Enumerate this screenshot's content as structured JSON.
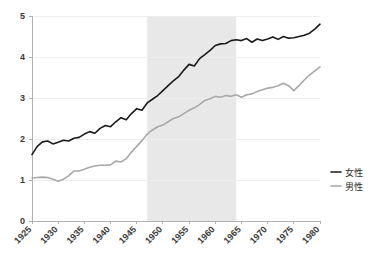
{
  "chart_data": {
    "type": "line",
    "title": "",
    "subtitle": "",
    "xlabel": "",
    "ylabel": "",
    "xlim": [
      1925,
      1980
    ],
    "ylim": [
      0,
      5
    ],
    "grid": true,
    "legend_position": "right",
    "x_tick_labels": [
      "1925",
      "1930",
      "1935",
      "1940",
      "1945",
      "1950",
      "1955",
      "1960",
      "1965",
      "1970",
      "1975",
      "1980"
    ],
    "x_ticks": [
      1925,
      1930,
      1935,
      1940,
      1945,
      1950,
      1955,
      1960,
      1965,
      1970,
      1975,
      1980
    ],
    "y_tick_labels": [
      "0",
      "1",
      "2",
      "3",
      "4",
      "5"
    ],
    "y_ticks": [
      0,
      1,
      2,
      3,
      4,
      5
    ],
    "shaded_region": {
      "x_start": 1947,
      "x_end": 1964,
      "color": "#e8e8e8"
    },
    "x": [
      1925,
      1926,
      1927,
      1928,
      1929,
      1930,
      1931,
      1932,
      1933,
      1934,
      1935,
      1936,
      1937,
      1938,
      1939,
      1940,
      1941,
      1942,
      1943,
      1944,
      1945,
      1946,
      1947,
      1948,
      1949,
      1950,
      1951,
      1952,
      1953,
      1954,
      1955,
      1956,
      1957,
      1958,
      1959,
      1960,
      1961,
      1962,
      1963,
      1964,
      1965,
      1966,
      1967,
      1968,
      1969,
      1970,
      1971,
      1972,
      1973,
      1974,
      1975,
      1976,
      1977,
      1978,
      1979,
      1980
    ],
    "series": [
      {
        "name": "女性",
        "color": "#1a1a1a",
        "width": 1.6,
        "values": [
          1.62,
          1.82,
          1.93,
          1.95,
          1.88,
          1.92,
          1.97,
          1.95,
          2.02,
          2.04,
          2.12,
          2.18,
          2.14,
          2.26,
          2.33,
          2.3,
          2.42,
          2.52,
          2.47,
          2.62,
          2.74,
          2.7,
          2.88,
          2.97,
          3.06,
          3.18,
          3.3,
          3.42,
          3.52,
          3.68,
          3.82,
          3.78,
          3.96,
          4.06,
          4.16,
          4.28,
          4.32,
          4.33,
          4.4,
          4.42,
          4.4,
          4.45,
          4.36,
          4.44,
          4.4,
          4.44,
          4.49,
          4.43,
          4.5,
          4.46,
          4.47,
          4.5,
          4.53,
          4.58,
          4.68,
          4.8
        ]
      },
      {
        "name": "男性",
        "color": "#a8a8a8",
        "width": 1.6,
        "values": [
          1.05,
          1.06,
          1.07,
          1.06,
          1.02,
          0.97,
          1.02,
          1.1,
          1.22,
          1.22,
          1.26,
          1.31,
          1.34,
          1.36,
          1.36,
          1.37,
          1.46,
          1.44,
          1.52,
          1.68,
          1.82,
          1.96,
          2.12,
          2.22,
          2.3,
          2.34,
          2.42,
          2.5,
          2.54,
          2.62,
          2.7,
          2.76,
          2.84,
          2.94,
          2.98,
          3.04,
          3.02,
          3.06,
          3.04,
          3.08,
          3.02,
          3.08,
          3.1,
          3.16,
          3.2,
          3.24,
          3.26,
          3.3,
          3.36,
          3.3,
          3.18,
          3.3,
          3.44,
          3.56,
          3.66,
          3.76
        ]
      }
    ],
    "legend": [
      {
        "label": "女性",
        "color": "#1a1a1a"
      },
      {
        "label": "男性",
        "color": "#a8a8a8"
      }
    ]
  },
  "axes": {
    "axis_color": "#b0b0b0",
    "grid_color": "#eeeeee",
    "tick_text_color": "#3a3a3a"
  }
}
